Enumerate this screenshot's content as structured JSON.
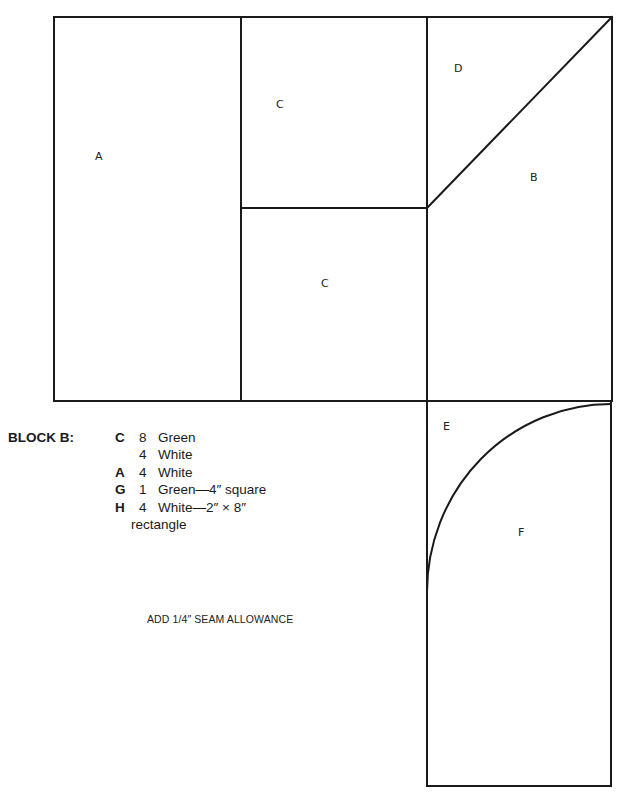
{
  "pattern": {
    "pieces": [
      {
        "id": "A",
        "label": "A"
      },
      {
        "id": "C1",
        "label": "C"
      },
      {
        "id": "C2",
        "label": "C"
      },
      {
        "id": "D",
        "label": "D"
      },
      {
        "id": "B",
        "label": "B"
      },
      {
        "id": "E",
        "label": "E"
      },
      {
        "id": "F",
        "label": "F"
      }
    ],
    "line_color": "#1a1a1a"
  },
  "legend": {
    "title": "BLOCK B:",
    "rows": [
      {
        "letter": "C",
        "count": "8",
        "desc": "Green"
      },
      {
        "letter": "",
        "count": "4",
        "desc": "White"
      },
      {
        "letter": "A",
        "count": "4",
        "desc": "White"
      },
      {
        "letter": "G",
        "count": "1",
        "desc": "Green—4″ square"
      },
      {
        "letter": "H",
        "count": "4",
        "desc": "White—2″ × 8″"
      }
    ],
    "continuation": "rectangle"
  },
  "note": "ADD 1/4″ SEAM ALLOWANCE"
}
